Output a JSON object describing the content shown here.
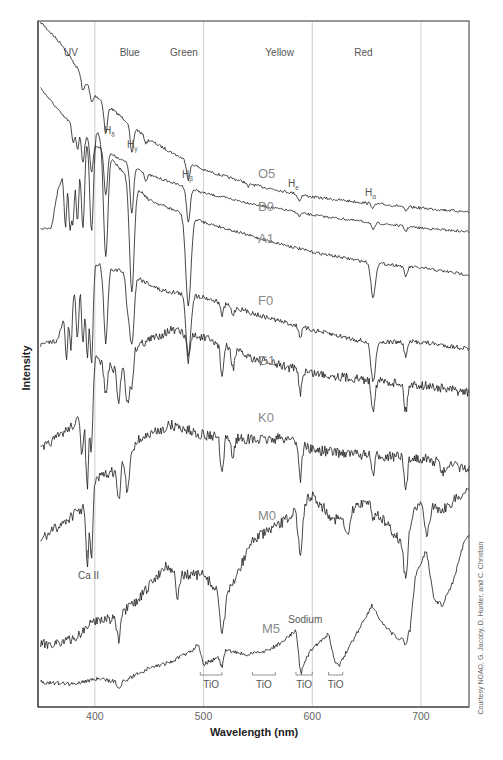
{
  "chart_data": {
    "type": "line",
    "title": "",
    "xlabel": "Wavelength (nm)",
    "ylabel": "Intensity",
    "xlim": [
      350,
      745
    ],
    "x_ticks": [
      400,
      500,
      600,
      700
    ],
    "grid": "vertical lines at 400, 500, 600, 700 nm",
    "color_bands": [
      {
        "label": "UV",
        "center_nm": 378
      },
      {
        "label": "Blue",
        "center_nm": 432
      },
      {
        "label": "Green",
        "center_nm": 482
      },
      {
        "label": "Yellow",
        "center_nm": 570
      },
      {
        "label": "Red",
        "center_nm": 647
      }
    ],
    "line_labels": [
      {
        "main": "H",
        "sub": "δ",
        "nm": 410
      },
      {
        "main": "H",
        "sub": "γ",
        "nm": 434
      },
      {
        "main": "H",
        "sub": "β",
        "nm": 486
      },
      {
        "main": "H",
        "sub": "e",
        "nm": 588
      },
      {
        "main": "H",
        "sub": "α",
        "nm": 656
      }
    ],
    "feature_labels": [
      {
        "text": "Ca II",
        "nm": 397,
        "y": 579
      },
      {
        "text": "Sodium",
        "nm": 589,
        "y": 623
      }
    ],
    "tio_bands": [
      {
        "label": "TiO",
        "from_nm": 497,
        "to_nm": 517
      },
      {
        "label": "TiO",
        "from_nm": 545,
        "to_nm": 566
      },
      {
        "label": "TiO",
        "from_nm": 585,
        "to_nm": 600
      },
      {
        "label": "TiO",
        "from_nm": 615,
        "to_nm": 628
      }
    ],
    "series": [
      {
        "name": "O5",
        "label_pos": [
          258,
          178
        ],
        "noise": 1.4,
        "continuum": [
          [
            350,
            22
          ],
          [
            370,
            45
          ],
          [
            400,
            95
          ],
          [
            450,
            140
          ],
          [
            500,
            170
          ],
          [
            550,
            186
          ],
          [
            600,
            197
          ],
          [
            650,
            203
          ],
          [
            700,
            208
          ],
          [
            745,
            212
          ]
        ],
        "lines": [
          [
            389,
            14,
            1.5
          ],
          [
            397,
            12,
            1.5
          ],
          [
            410,
            30,
            1.5
          ],
          [
            434,
            28,
            1.5
          ],
          [
            447,
            6,
            1.2
          ],
          [
            486,
            18,
            1.5
          ],
          [
            541,
            4,
            1.2
          ],
          [
            588,
            6,
            1.5
          ],
          [
            656,
            4,
            1.5
          ],
          [
            686,
            5,
            1.5
          ]
        ]
      },
      {
        "name": "B0",
        "label_pos": [
          258,
          211
        ],
        "noise": 1.2,
        "continuum": [
          [
            350,
            88
          ],
          [
            370,
            115
          ],
          [
            400,
            145
          ],
          [
            450,
            175
          ],
          [
            500,
            193
          ],
          [
            550,
            205
          ],
          [
            600,
            215
          ],
          [
            650,
            222
          ],
          [
            700,
            228
          ],
          [
            745,
            232
          ]
        ],
        "lines": [
          [
            380,
            18,
            1.2
          ],
          [
            384,
            20,
            1.2
          ],
          [
            389,
            28,
            1.3
          ],
          [
            397,
            30,
            1.4
          ],
          [
            410,
            45,
            1.5
          ],
          [
            434,
            48,
            1.6
          ],
          [
            447,
            8,
            1.2
          ],
          [
            486,
            35,
            1.6
          ],
          [
            588,
            4,
            1.2
          ],
          [
            656,
            8,
            1.4
          ],
          [
            686,
            5,
            1.3
          ]
        ]
      },
      {
        "name": "A1",
        "label_pos": [
          258,
          243
        ],
        "noise": 1.5,
        "continuum": [
          [
            350,
            228
          ],
          [
            360,
            228
          ],
          [
            366,
            190
          ],
          [
            380,
            145
          ],
          [
            400,
            128
          ],
          [
            420,
            165
          ],
          [
            450,
            200
          ],
          [
            500,
            222
          ],
          [
            550,
            238
          ],
          [
            600,
            252
          ],
          [
            650,
            262
          ],
          [
            700,
            268
          ],
          [
            745,
            275
          ]
        ],
        "lines": [
          [
            373,
            60,
            1.2
          ],
          [
            377,
            70,
            1.2
          ],
          [
            380,
            75,
            1.3
          ],
          [
            384,
            80,
            1.3
          ],
          [
            389,
            90,
            1.6
          ],
          [
            397,
            100,
            1.8
          ],
          [
            410,
            110,
            2.0
          ],
          [
            434,
            110,
            2.2
          ],
          [
            486,
            90,
            2.4
          ],
          [
            656,
            35,
            2.0
          ],
          [
            686,
            10,
            1.5
          ]
        ]
      },
      {
        "name": "F0",
        "label_pos": [
          258,
          305
        ],
        "noise": 2.4,
        "continuum": [
          [
            350,
            345
          ],
          [
            366,
            340
          ],
          [
            376,
            300
          ],
          [
            392,
            258
          ],
          [
            410,
            268
          ],
          [
            430,
            272
          ],
          [
            460,
            290
          ],
          [
            500,
            297
          ],
          [
            550,
            315
          ],
          [
            600,
            330
          ],
          [
            650,
            342
          ],
          [
            700,
            342
          ],
          [
            745,
            349
          ]
        ],
        "lines": [
          [
            374,
            50,
            1.2
          ],
          [
            378,
            55,
            1.2
          ],
          [
            384,
            60,
            1.3
          ],
          [
            389,
            75,
            1.3
          ],
          [
            393,
            95,
            1.4
          ],
          [
            397,
            100,
            1.4
          ],
          [
            410,
            75,
            1.8
          ],
          [
            430,
            30,
            1.6
          ],
          [
            434,
            70,
            2.0
          ],
          [
            486,
            60,
            2.2
          ],
          [
            517,
            12,
            1.4
          ],
          [
            527,
            8,
            1.4
          ],
          [
            589,
            10,
            1.4
          ],
          [
            656,
            40,
            2.0
          ],
          [
            686,
            14,
            1.5
          ]
        ]
      },
      {
        "name": "G1",
        "label_pos": [
          258,
          365
        ],
        "noise": 4.6,
        "continuum": [
          [
            350,
            450
          ],
          [
            380,
            425
          ],
          [
            393,
            408
          ],
          [
            400,
            358
          ],
          [
            420,
            370
          ],
          [
            440,
            345
          ],
          [
            470,
            330
          ],
          [
            500,
            338
          ],
          [
            550,
            360
          ],
          [
            600,
            373
          ],
          [
            650,
            380
          ],
          [
            700,
            385
          ],
          [
            745,
            393
          ]
        ],
        "lines": [
          [
            388,
            40,
            1.3
          ],
          [
            393,
            80,
            1.3
          ],
          [
            397,
            70,
            1.3
          ],
          [
            410,
            30,
            1.5
          ],
          [
            422,
            35,
            1.5
          ],
          [
            430,
            45,
            1.8
          ],
          [
            434,
            30,
            1.5
          ],
          [
            486,
            25,
            1.6
          ],
          [
            517,
            30,
            1.4
          ],
          [
            527,
            18,
            1.4
          ],
          [
            589,
            22,
            1.4
          ],
          [
            656,
            28,
            1.6
          ],
          [
            686,
            28,
            1.5
          ]
        ]
      },
      {
        "name": "K0",
        "label_pos": [
          258,
          422
        ],
        "noise": 5.2,
        "continuum": [
          [
            350,
            540
          ],
          [
            380,
            515
          ],
          [
            393,
            505
          ],
          [
            400,
            480
          ],
          [
            420,
            470
          ],
          [
            440,
            440
          ],
          [
            470,
            425
          ],
          [
            500,
            435
          ],
          [
            550,
            440
          ],
          [
            580,
            438
          ],
          [
            600,
            450
          ],
          [
            650,
            455
          ],
          [
            700,
            458
          ],
          [
            745,
            470
          ]
        ],
        "lines": [
          [
            393,
            60,
            1.3
          ],
          [
            397,
            65,
            1.3
          ],
          [
            422,
            35,
            1.5
          ],
          [
            430,
            40,
            1.6
          ],
          [
            517,
            40,
            1.5
          ],
          [
            527,
            20,
            1.4
          ],
          [
            589,
            35,
            1.4
          ],
          [
            656,
            20,
            1.4
          ],
          [
            686,
            35,
            1.5
          ],
          [
            720,
            12,
            1.5
          ]
        ]
      },
      {
        "name": "M0",
        "label_pos": [
          258,
          520
        ],
        "noise": 5.2,
        "continuum": [
          [
            350,
            645
          ],
          [
            380,
            640
          ],
          [
            400,
            620
          ],
          [
            420,
            618
          ],
          [
            440,
            600
          ],
          [
            465,
            565
          ],
          [
            480,
            575
          ],
          [
            500,
            575
          ],
          [
            520,
            600
          ],
          [
            545,
            540
          ],
          [
            570,
            525
          ],
          [
            585,
            510
          ],
          [
            600,
            495
          ],
          [
            620,
            520
          ],
          [
            650,
            500
          ],
          [
            680,
            540
          ],
          [
            700,
            500
          ],
          [
            720,
            510
          ],
          [
            745,
            488
          ]
        ],
        "lines": [
          [
            422,
            25,
            1.6
          ],
          [
            476,
            25,
            1.6
          ],
          [
            517,
            35,
            2.0
          ],
          [
            589,
            45,
            2.0
          ],
          [
            632,
            25,
            2.5
          ],
          [
            656,
            10,
            1.5
          ],
          [
            686,
            50,
            2.0
          ],
          [
            705,
            30,
            2.5
          ]
        ]
      },
      {
        "name": "M5",
        "label_pos": [
          262,
          633
        ],
        "noise": 2.0,
        "continuum": [
          [
            350,
            682
          ],
          [
            380,
            684
          ],
          [
            400,
            679
          ],
          [
            425,
            682
          ],
          [
            450,
            668
          ],
          [
            470,
            662
          ],
          [
            490,
            650
          ],
          [
            495,
            643
          ],
          [
            500,
            664
          ],
          [
            515,
            657
          ],
          [
            520,
            650
          ],
          [
            540,
            655
          ],
          [
            560,
            650
          ],
          [
            575,
            640
          ],
          [
            585,
            630
          ],
          [
            590,
            668
          ],
          [
            600,
            648
          ],
          [
            610,
            640
          ],
          [
            615,
            633
          ],
          [
            620,
            660
          ],
          [
            625,
            665
          ],
          [
            640,
            635
          ],
          [
            655,
            605
          ],
          [
            665,
            625
          ],
          [
            680,
            640
          ],
          [
            690,
            630
          ],
          [
            695,
            575
          ],
          [
            705,
            550
          ],
          [
            712,
            600
          ],
          [
            720,
            605
          ],
          [
            730,
            580
          ],
          [
            740,
            540
          ],
          [
            745,
            535
          ]
        ],
        "lines": [
          [
            422,
            8,
            1.5
          ],
          [
            517,
            12,
            1.5
          ],
          [
            589,
            10,
            1.2
          ],
          [
            686,
            12,
            1.5
          ]
        ]
      }
    ],
    "credit": "Courtesy NOAO, G. Jacoby, D. Hunter, and C. Christian"
  }
}
